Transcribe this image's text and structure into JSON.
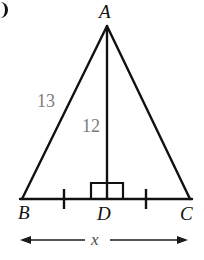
{
  "figure": {
    "type": "geometry-diagram",
    "colors": {
      "stroke": "#111111",
      "measure_text": "#7d7d7d",
      "vertex_text": "#111111",
      "background": "#ffffff"
    },
    "vertices": [
      {
        "name": "A",
        "label": "A",
        "x": 107,
        "y": 26
      },
      {
        "name": "B",
        "label": "B",
        "x": 22,
        "y": 199
      },
      {
        "name": "C",
        "label": "C",
        "x": 190,
        "y": 199
      },
      {
        "name": "D",
        "label": "D",
        "x": 107,
        "y": 199
      }
    ],
    "segments": [
      {
        "name": "side-AB",
        "from": "A",
        "to": "B",
        "label": "13"
      },
      {
        "name": "side-AC",
        "from": "A",
        "to": "C",
        "label": ""
      },
      {
        "name": "base-BC",
        "from": "B",
        "to": "C",
        "label": ""
      },
      {
        "name": "altitude-AD",
        "from": "A",
        "to": "D",
        "label": "12"
      }
    ],
    "labels": {
      "side_13": "13",
      "altitude_12": "12",
      "base_variable": "x"
    },
    "markers": {
      "right_angle": {
        "name": "right-angle-at-D",
        "vertex": "D",
        "size": 16
      },
      "congruence_ticks": [
        {
          "name": "tick-BD",
          "x": 64,
          "segment": "BD"
        },
        {
          "name": "tick-DC",
          "x": 146,
          "segment": "DC"
        }
      ]
    },
    "dimension": {
      "name": "base-dimension-BC",
      "label": "x",
      "from_x": 20,
      "to_x": 188,
      "y": 240
    }
  }
}
